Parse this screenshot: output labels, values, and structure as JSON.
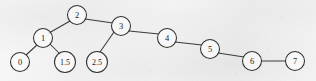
{
  "figure": {
    "width": 316,
    "height": 81,
    "background_color": "#f4f4f4",
    "stroke_color": "#313131",
    "label_color": "#1d1d1d",
    "node_fill": "#fbfbfb"
  },
  "graph_data": {
    "type": "tree",
    "node_radius_default": 9.5,
    "nodes": [
      {
        "id": "n0",
        "label": "0",
        "cx": 20,
        "cy": 62,
        "r": 9.5,
        "font_size": 8.5
      },
      {
        "id": "n1",
        "label": "1",
        "cx": 43,
        "cy": 38,
        "r": 9.5,
        "font_size": 8.5
      },
      {
        "id": "n1_5",
        "label": "1.5",
        "cx": 65,
        "cy": 62,
        "r": 10.5,
        "font_size": 8.0
      },
      {
        "id": "n2",
        "label": "2",
        "cx": 77,
        "cy": 15,
        "r": 9.5,
        "font_size": 8.5
      },
      {
        "id": "n2_5",
        "label": "2.5",
        "cx": 97,
        "cy": 62,
        "r": 10.5,
        "font_size": 8.0
      },
      {
        "id": "n3",
        "label": "3",
        "cx": 121,
        "cy": 26,
        "r": 9.5,
        "font_size": 8.5
      },
      {
        "id": "n4",
        "label": "4",
        "cx": 167,
        "cy": 38,
        "r": 9.5,
        "font_size": 8.5
      },
      {
        "id": "n5",
        "label": "5",
        "cx": 210,
        "cy": 49,
        "r": 9.5,
        "font_size": 8.5
      },
      {
        "id": "n6",
        "label": "6",
        "cx": 252,
        "cy": 61,
        "r": 9.5,
        "font_size": 8.5
      },
      {
        "id": "n7",
        "label": "7",
        "cx": 295,
        "cy": 61,
        "r": 9.5,
        "font_size": 8.5
      }
    ],
    "edges": [
      {
        "id": "e-2-1",
        "from": "n2",
        "to": "n1",
        "x1": 70,
        "y1": 21,
        "x2": 49,
        "y2": 33
      },
      {
        "id": "e-2-3",
        "from": "n2",
        "to": "n3",
        "x1": 85,
        "y1": 19,
        "x2": 113,
        "y2": 23
      },
      {
        "id": "e-1-0",
        "from": "n1",
        "to": "n0",
        "x1": 37,
        "y1": 45,
        "x2": 26,
        "y2": 55
      },
      {
        "id": "e-1-15",
        "from": "n1",
        "to": "n1_5",
        "x1": 50,
        "y1": 44,
        "x2": 60,
        "y2": 54
      },
      {
        "id": "e-3-25",
        "from": "n3",
        "to": "n2_5",
        "x1": 114,
        "y1": 32,
        "x2": 100,
        "y2": 52
      },
      {
        "id": "e-3-4",
        "from": "n3",
        "to": "n4",
        "x1": 129,
        "y1": 31,
        "x2": 159,
        "y2": 34
      },
      {
        "id": "e-4-5",
        "from": "n4",
        "to": "n5",
        "x1": 175,
        "y1": 42,
        "x2": 202,
        "y2": 45
      },
      {
        "id": "e-5-6",
        "from": "n5",
        "to": "n6",
        "x1": 218,
        "y1": 53,
        "x2": 244,
        "y2": 57
      },
      {
        "id": "e-6-7",
        "from": "n6",
        "to": "n7",
        "x1": 262,
        "y1": 61,
        "x2": 285,
        "y2": 61
      }
    ],
    "specks": [
      {
        "x": 268,
        "y": 48,
        "size": 1.4
      },
      {
        "x": 281,
        "y": 16,
        "size": 1.1
      },
      {
        "x": 236,
        "y": 72,
        "size": 1.0
      },
      {
        "x": 150,
        "y": 70,
        "size": 1.0
      },
      {
        "x": 95,
        "y": 9,
        "size": 0.9
      }
    ]
  }
}
